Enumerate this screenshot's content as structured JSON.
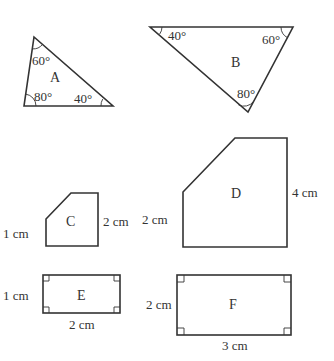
{
  "shapes": {
    "A": {
      "label": "A",
      "angles": {
        "top": "60°",
        "bottom_left": "80°",
        "bottom_right": "40°"
      }
    },
    "B": {
      "label": "B",
      "angles": {
        "top_left": "40°",
        "top_right": "60°",
        "bottom": "80°"
      }
    },
    "C": {
      "label": "C",
      "left_side": "1 cm",
      "right_side": "2 cm"
    },
    "D": {
      "label": "D",
      "left_side": "2 cm",
      "right_side": "4 cm"
    },
    "E": {
      "label": "E",
      "height": "1 cm",
      "width": "2 cm"
    },
    "F": {
      "label": "F",
      "height": "2 cm",
      "width": "3 cm"
    }
  },
  "colors": {
    "stroke": "#333333",
    "background": "#ffffff"
  }
}
